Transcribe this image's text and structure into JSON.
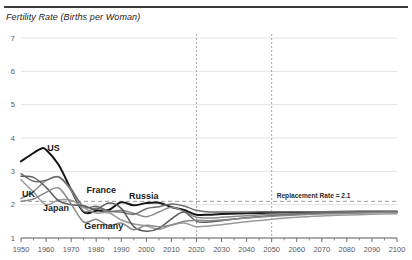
{
  "chart_data": {
    "type": "line",
    "title": "Fertility Rate (Births per Woman)",
    "xlabel": "",
    "ylabel": "",
    "xlim": [
      1950,
      2100
    ],
    "ylim": [
      1,
      7
    ],
    "xticks": [
      1950,
      1960,
      1970,
      1980,
      1990,
      2000,
      2010,
      2020,
      2030,
      2040,
      2050,
      2060,
      2070,
      2080,
      2090,
      2100
    ],
    "yticks": [
      1,
      2,
      3,
      4,
      5,
      6,
      7
    ],
    "grid": "horizontal",
    "legend_position": "inline-labels",
    "annotations": [
      {
        "name": "replacement-rate",
        "text": "Replacement Rate = 2.1",
        "value": 2.1,
        "x": 2052,
        "style": "dashed-horizontal"
      },
      {
        "name": "year-2020-marker",
        "text": "",
        "value": 2020,
        "style": "dashed-vertical"
      },
      {
        "name": "year-2050-marker",
        "text": "",
        "value": 2050,
        "style": "dashed-vertical"
      }
    ],
    "series": [
      {
        "name": "US",
        "color": "#141414",
        "width": 2.0,
        "label_x": 1963,
        "label_y": 3.62,
        "x": [
          1950,
          1955,
          1958,
          1960,
          1965,
          1970,
          1975,
          1980,
          1985,
          1990,
          1995,
          2000,
          2005,
          2010,
          2015,
          2020,
          2025,
          2030,
          2040,
          2050,
          2060,
          2070,
          2080,
          2090,
          2100
        ],
        "y": [
          3.3,
          3.55,
          3.68,
          3.65,
          3.2,
          2.45,
          1.78,
          1.82,
          1.84,
          2.07,
          1.98,
          2.05,
          2.06,
          1.93,
          1.84,
          1.7,
          1.7,
          1.72,
          1.74,
          1.76,
          1.77,
          1.78,
          1.78,
          1.79,
          1.79
        ]
      },
      {
        "name": "UK",
        "color": "#8c8c8e",
        "width": 1.5,
        "label_x": 1953,
        "label_y": 2.22,
        "x": [
          1950,
          1955,
          1960,
          1965,
          1970,
          1975,
          1980,
          1985,
          1990,
          1995,
          2000,
          2005,
          2010,
          2015,
          2020,
          2025,
          2030,
          2040,
          2050,
          2060,
          2070,
          2080,
          2090,
          2100
        ],
        "y": [
          2.18,
          2.4,
          2.72,
          2.83,
          2.43,
          1.81,
          1.9,
          1.79,
          1.83,
          1.74,
          1.64,
          1.78,
          1.92,
          1.8,
          1.62,
          1.6,
          1.62,
          1.67,
          1.71,
          1.73,
          1.75,
          1.76,
          1.77,
          1.78
        ]
      },
      {
        "name": "France",
        "color": "#6e6e70",
        "width": 1.5,
        "label_x": 1982,
        "label_y": 2.36,
        "x": [
          1950,
          1955,
          1960,
          1965,
          1970,
          1975,
          1980,
          1985,
          1990,
          1995,
          2000,
          2005,
          2010,
          2015,
          2020,
          2025,
          2030,
          2040,
          2050,
          2060,
          2070,
          2080,
          2090,
          2100
        ],
        "y": [
          2.93,
          2.7,
          2.73,
          2.84,
          2.47,
          1.93,
          1.95,
          1.81,
          1.78,
          1.71,
          1.88,
          1.94,
          2.02,
          1.96,
          1.83,
          1.78,
          1.78,
          1.78,
          1.79,
          1.79,
          1.79,
          1.8,
          1.8,
          1.8
        ]
      },
      {
        "name": "Japan",
        "color": "#9a9a9c",
        "width": 1.5,
        "label_x": 1964,
        "label_y": 1.8,
        "x": [
          1950,
          1955,
          1960,
          1965,
          1970,
          1975,
          1980,
          1985,
          1990,
          1995,
          2000,
          2005,
          2010,
          2015,
          2020,
          2025,
          2030,
          2040,
          2050,
          2060,
          2070,
          2080,
          2090,
          2100
        ],
        "y": [
          2.75,
          2.37,
          2.0,
          2.14,
          2.13,
          1.91,
          1.75,
          1.76,
          1.54,
          1.42,
          1.36,
          1.26,
          1.39,
          1.45,
          1.34,
          1.36,
          1.4,
          1.49,
          1.56,
          1.62,
          1.66,
          1.69,
          1.71,
          1.73
        ]
      },
      {
        "name": "Russia",
        "color": "#5c5c5e",
        "width": 1.5,
        "label_x": 1999,
        "label_y": 2.18,
        "x": [
          1950,
          1955,
          1960,
          1965,
          1970,
          1975,
          1980,
          1985,
          1990,
          1995,
          2000,
          2005,
          2010,
          2015,
          2020,
          2025,
          2030,
          2040,
          2050,
          2060,
          2070,
          2080,
          2090,
          2100
        ],
        "y": [
          2.85,
          2.82,
          2.52,
          2.12,
          2.0,
          1.97,
          1.86,
          2.05,
          1.89,
          1.34,
          1.2,
          1.29,
          1.57,
          1.78,
          1.5,
          1.48,
          1.52,
          1.61,
          1.67,
          1.71,
          1.74,
          1.76,
          1.77,
          1.78
        ]
      },
      {
        "name": "Germany",
        "color": "#8a8a8c",
        "width": 1.5,
        "label_x": 1983,
        "label_y": 1.26,
        "x": [
          1950,
          1955,
          1960,
          1965,
          1970,
          1975,
          1980,
          1985,
          1990,
          1995,
          2000,
          2005,
          2010,
          2015,
          2020,
          2025,
          2030,
          2040,
          2050,
          2060,
          2070,
          2080,
          2090,
          2100
        ],
        "y": [
          2.1,
          2.17,
          2.37,
          2.5,
          2.02,
          1.48,
          1.56,
          1.37,
          1.45,
          1.25,
          1.38,
          1.34,
          1.39,
          1.5,
          1.53,
          1.52,
          1.54,
          1.6,
          1.65,
          1.69,
          1.72,
          1.74,
          1.76,
          1.77
        ]
      }
    ]
  },
  "axis": {
    "y_tick_labels": [
      "1",
      "2",
      "3",
      "4",
      "5",
      "6",
      "7"
    ],
    "x_tick_labels": [
      "1950",
      "1960",
      "1970",
      "1980",
      "1990",
      "2000",
      "2010",
      "2020",
      "2030",
      "2040",
      "2050",
      "2060",
      "2070",
      "2080",
      "2090",
      "2100"
    ]
  },
  "colors": {
    "grid": "#dcdcde",
    "axis": "#6a6a6c",
    "dashed": "#8e8e90",
    "rule": "#3b3b3b",
    "text": "#1a1a1a"
  }
}
